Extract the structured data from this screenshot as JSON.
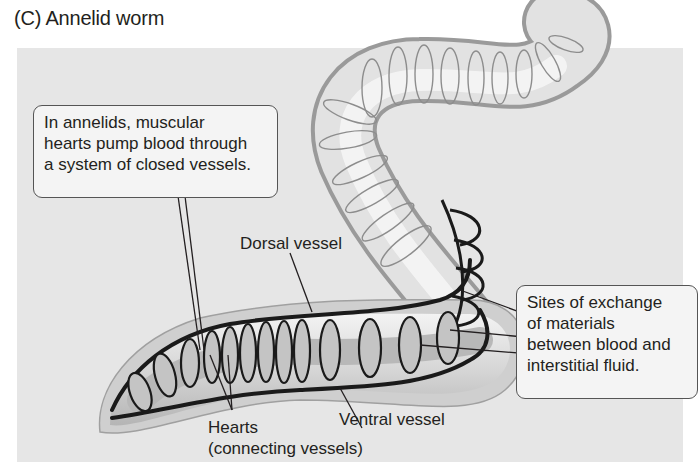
{
  "title": "(C)  Annelid worm",
  "colors": {
    "background": "#ffffff",
    "panel": "#e6e6e6",
    "worm_body": "#d9d9d9",
    "vessel": "#1a1a1a",
    "text": "#231f20"
  },
  "callouts": {
    "intro": {
      "lines": [
        "In annelids, muscular",
        "hearts pump blood through",
        "a system of closed vessels."
      ]
    },
    "exchange": {
      "lines": [
        "Sites of exchange",
        "of materials",
        "between blood and",
        "interstitial fluid."
      ]
    }
  },
  "labels": {
    "dorsal_vessel": "Dorsal vessel",
    "ventral_vessel": "Ventral vessel",
    "hearts": "Hearts",
    "hearts_sub": "(connecting vessels)"
  }
}
